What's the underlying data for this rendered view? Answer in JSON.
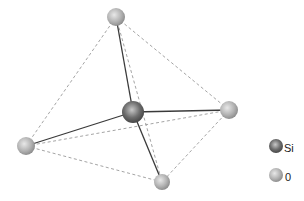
{
  "diagram": {
    "atoms": [
      {
        "id": "O_top",
        "element": "O",
        "x": 116,
        "y": 17,
        "r": 9
      },
      {
        "id": "O_right",
        "element": "O",
        "x": 229,
        "y": 110,
        "r": 9
      },
      {
        "id": "O_left",
        "element": "O",
        "x": 26,
        "y": 146,
        "r": 9
      },
      {
        "id": "O_bottom",
        "element": "O",
        "x": 162,
        "y": 182,
        "r": 8
      },
      {
        "id": "Si_center",
        "element": "Si",
        "x": 133,
        "y": 112,
        "r": 11
      }
    ],
    "bonds": [
      [
        "Si_center",
        "O_top"
      ],
      [
        "Si_center",
        "O_right"
      ],
      [
        "Si_center",
        "O_left"
      ],
      [
        "Si_center",
        "O_bottom"
      ]
    ],
    "edges_dashed": [
      [
        "O_top",
        "O_left"
      ],
      [
        "O_top",
        "O_right"
      ],
      [
        "O_top",
        "O_bottom"
      ],
      [
        "O_left",
        "O_right"
      ],
      [
        "O_left",
        "O_bottom"
      ],
      [
        "O_right",
        "O_bottom"
      ]
    ]
  },
  "legend": {
    "items": [
      {
        "label": "Si",
        "color": "#6e6e6e"
      },
      {
        "label": "0",
        "color": "#b5b5b5"
      }
    ]
  },
  "colors": {
    "bond": "#333333",
    "dashed_edge": "#999999",
    "si_fill": "#6e6e6e",
    "o_fill": "#b5b5b5"
  }
}
